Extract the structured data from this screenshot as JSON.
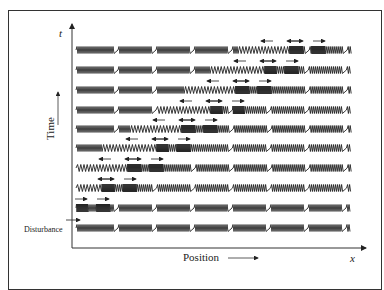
{
  "diagram": {
    "axes": {
      "y_symbol": "t",
      "x_symbol": "x",
      "y_label": "Time",
      "x_label": "Position"
    },
    "annotation": "Disturbance",
    "rows": [
      {
        "row": 1,
        "note": "disturbance initiated, rightward arrow at left end"
      },
      {
        "row": 2,
        "note": "compression pair moves right"
      },
      {
        "row": 3,
        "note": "compressions propagate right, rarefaction left"
      },
      {
        "row": 4,
        "note": ""
      },
      {
        "row": 5,
        "note": ""
      },
      {
        "row": 6,
        "note": ""
      },
      {
        "row": 7,
        "note": ""
      },
      {
        "row": 8,
        "note": ""
      },
      {
        "row": 9,
        "note": ""
      },
      {
        "row": 10,
        "note": "compressions near right end"
      }
    ]
  }
}
